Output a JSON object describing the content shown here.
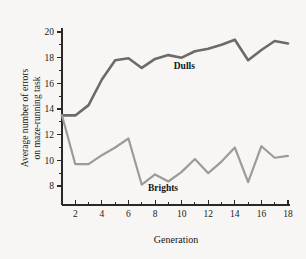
{
  "figure": {
    "background_color": "#f7f6f4",
    "axis_color": "#2a2724"
  },
  "chart_data": {
    "type": "line",
    "title": "",
    "xlabel": "Generation",
    "ylabel": "Average number of errors on maze-running task",
    "ylabel_line1": "Average number of errors",
    "ylabel_line2": "on maze-running task",
    "xlim": [
      1,
      18
    ],
    "ylim": [
      7,
      20
    ],
    "xticks": [
      2,
      4,
      6,
      8,
      10,
      12,
      14,
      16,
      18
    ],
    "xtick_labels": [
      "2",
      "4",
      "6",
      "8",
      "10",
      "12",
      "14",
      "16",
      "18"
    ],
    "xminor_ticks": [
      3,
      5,
      7,
      9,
      11,
      13,
      15,
      17
    ],
    "yticks": [
      8,
      10,
      12,
      14,
      16,
      18,
      20
    ],
    "ytick_labels": [
      "8",
      "10",
      "12",
      "14",
      "16",
      "18",
      "20"
    ],
    "yminor_ticks": [
      9,
      11,
      13,
      15,
      17,
      19
    ],
    "grid": false,
    "legend_position": "inline-annotation",
    "x": [
      1,
      2,
      3,
      4,
      5,
      6,
      7,
      8,
      9,
      10,
      11,
      12,
      13,
      14,
      15,
      16,
      17,
      18
    ],
    "series": [
      {
        "name": "Dulls",
        "color": "#6e6b67",
        "label_x": 10.2,
        "label_y": 17.1,
        "values": [
          13.5,
          13.5,
          14.3,
          16.3,
          17.8,
          17.95,
          17.2,
          17.9,
          18.2,
          18.0,
          18.5,
          18.7,
          19.0,
          19.4,
          17.8,
          18.6,
          19.3,
          19.1
        ]
      },
      {
        "name": "Brights",
        "color": "#9d9b98",
        "label_x": 8.6,
        "label_y": 7.6,
        "values": [
          13.5,
          9.7,
          9.7,
          10.4,
          11.0,
          11.7,
          8.1,
          8.9,
          8.35,
          9.1,
          10.1,
          9.0,
          9.9,
          11.0,
          8.3,
          11.1,
          10.2,
          10.35
        ]
      }
    ],
    "annotations": [
      {
        "text": "Dulls",
        "x": 10.2,
        "y": 17.1
      },
      {
        "text": "Brights",
        "x": 8.6,
        "y": 7.6
      }
    ]
  }
}
